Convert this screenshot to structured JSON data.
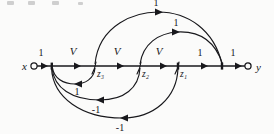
{
  "figure": {
    "type": "signal-flow-graph",
    "background_color": "#fbfbfa",
    "ink_color": "#18181c",
    "terminals": {
      "input_label": "x",
      "output_label": "y"
    },
    "nodes": [
      {
        "id": "x",
        "label": "x",
        "x": 30,
        "y": 66
      },
      {
        "id": "n1",
        "label": "",
        "x": 52,
        "y": 66
      },
      {
        "id": "z3",
        "label": "z₃",
        "x": 95,
        "y": 66
      },
      {
        "id": "z2",
        "label": "z₂",
        "x": 140,
        "y": 66
      },
      {
        "id": "z1",
        "label": "z₁",
        "x": 178,
        "y": 66
      },
      {
        "id": "n5",
        "label": "",
        "x": 222,
        "y": 66
      },
      {
        "id": "y",
        "label": "y",
        "x": 252,
        "y": 66
      }
    ],
    "spine_edges": [
      {
        "from": "x",
        "to": "n1",
        "label": "1",
        "label_x": 41,
        "label_y": 56
      },
      {
        "from": "n1",
        "to": "z3",
        "label": "V",
        "label_x": 73,
        "label_y": 55
      },
      {
        "from": "z3",
        "to": "z2",
        "label": "V",
        "label_x": 117,
        "label_y": 55
      },
      {
        "from": "z2",
        "to": "z1",
        "label": "V",
        "label_x": 159,
        "label_y": 55
      },
      {
        "from": "z1",
        "to": "n5",
        "label": "1",
        "label_x": 200,
        "label_y": 56
      },
      {
        "from": "n5",
        "to": "y",
        "label": "1",
        "label_x": 233,
        "label_y": 56
      }
    ],
    "upper_arcs": [
      {
        "from": "z3",
        "to": "n5",
        "label": "1",
        "label_x": 156,
        "label_y": 17,
        "direction": "right"
      },
      {
        "from": "z2",
        "to": "n5",
        "label": "1",
        "label_x": 175,
        "label_y": 36,
        "direction": "right"
      }
    ],
    "lower_arcs": [
      {
        "from": "z3",
        "to": "n1",
        "label": "1",
        "label_x": 77,
        "label_y": 86,
        "direction": "left"
      },
      {
        "from": "z2",
        "to": "n1",
        "label": "-1",
        "label_x": 96,
        "label_y": 105,
        "direction": "left"
      },
      {
        "from": "z1",
        "to": "n1",
        "label": "-1",
        "label_x": 120,
        "label_y": 128,
        "direction": "left"
      }
    ],
    "labels": {
      "gain_unity": "1",
      "gain_negative": "-1",
      "gain_variable": "V",
      "state_3": "z₃",
      "state_2": "z₂",
      "state_1": "z₁"
    }
  }
}
